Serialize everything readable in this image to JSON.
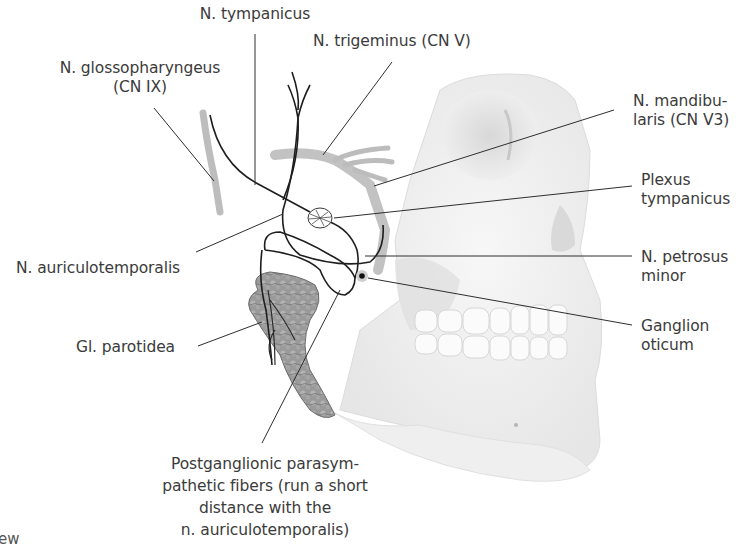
{
  "diagram": {
    "colors": {
      "text": "#3b3b3b",
      "leader_line": "#2e2e2e",
      "nerve": "#1e1e1e",
      "skull": "#ececec",
      "parotid": "#8a8a8a",
      "background": "#ffffff"
    },
    "labels": {
      "n_tympanicus": {
        "lines": [
          "N. tympanicus"
        ]
      },
      "n_trigeminus": {
        "lines": [
          "N. trigeminus (CN V)"
        ]
      },
      "n_glossopharyngeus": {
        "lines": [
          "N. glossopharyngeus",
          "(CN IX)"
        ]
      },
      "n_mandibularis": {
        "lines": [
          "N. mandibu-",
          "laris (CN V3)"
        ]
      },
      "plexus_tympanicus": {
        "lines": [
          "Plexus",
          "tympanicus"
        ]
      },
      "n_auriculotemporalis": {
        "lines": [
          "N. auriculotemporalis"
        ]
      },
      "n_petrosus_minor": {
        "lines": [
          "N. petrosus",
          "minor"
        ]
      },
      "gl_parotidea": {
        "lines": [
          "Gl. parotidea"
        ]
      },
      "ganglion_oticum": {
        "lines": [
          "Ganglion",
          "oticum"
        ]
      },
      "postganglionic": {
        "lines": [
          "Postganglionic parasym-",
          "pathetic fibers (run a short",
          "distance with the",
          "n. auriculotemporalis)"
        ]
      }
    },
    "cropped_caption_fragment": "ew"
  }
}
